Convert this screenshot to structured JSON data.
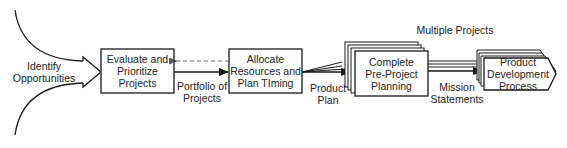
{
  "diagram": {
    "type": "flowchart",
    "input_label": [
      "Identify",
      "Opportunities"
    ],
    "nodes": [
      {
        "id": "evaluate",
        "lines": [
          "Evaluate and",
          "Prioritize",
          "Projects"
        ]
      },
      {
        "id": "allocate",
        "lines": [
          "Allocate",
          "Resources and",
          "Plan TIming"
        ]
      },
      {
        "id": "preproject",
        "lines": [
          "Complete",
          "Pre-Project",
          "Planning"
        ],
        "stacked": true
      },
      {
        "id": "pdp",
        "lines": [
          "Product",
          "Development",
          "Process"
        ],
        "stacked": true,
        "shape": "pentagon-arrow"
      }
    ],
    "edges": [
      {
        "from": "evaluate",
        "to": "allocate",
        "label": [
          "Portfolio of",
          "Projects"
        ],
        "style": "solid"
      },
      {
        "from": "allocate",
        "to": "evaluate",
        "label": [],
        "style": "dashed"
      },
      {
        "from": "allocate",
        "to": "preproject",
        "label": [
          "Product",
          "Plan"
        ],
        "style": "solid-fan"
      },
      {
        "from": "preproject",
        "to": "pdp",
        "label": [
          "Mission",
          "Statements"
        ],
        "style": "solid-multi"
      }
    ],
    "annotation": "Multiple Projects",
    "colors": {
      "stroke": "#1a1a1a",
      "dashed": "#777777",
      "fill": "#ffffff"
    }
  }
}
